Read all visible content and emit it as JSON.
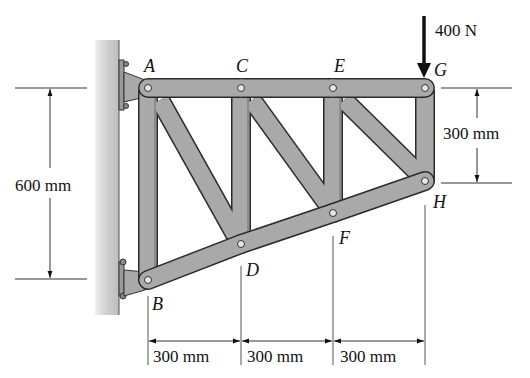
{
  "figure": {
    "type": "truss-diagram",
    "joints": [
      {
        "id": "A",
        "label": "A"
      },
      {
        "id": "B",
        "label": "B"
      },
      {
        "id": "C",
        "label": "C"
      },
      {
        "id": "D",
        "label": "D"
      },
      {
        "id": "E",
        "label": "E"
      },
      {
        "id": "F",
        "label": "F"
      },
      {
        "id": "G",
        "label": "G"
      },
      {
        "id": "H",
        "label": "H"
      }
    ],
    "load": {
      "label": "400 N",
      "joint": "G",
      "direction": "down"
    },
    "dimensions": {
      "left_height": "600 mm",
      "right_height": "300 mm",
      "spans": [
        "300 mm",
        "300 mm",
        "300 mm"
      ]
    },
    "members": [
      "AC",
      "CE",
      "EG",
      "AB",
      "CD",
      "EF",
      "GH",
      "BD",
      "DF",
      "FH",
      "AD",
      "CF",
      "EH"
    ],
    "colors": {
      "member_fill": "#a9a9a9",
      "member_stroke": "#2a2a2a",
      "wall": "#c8c8c8",
      "text": "#111111"
    }
  }
}
